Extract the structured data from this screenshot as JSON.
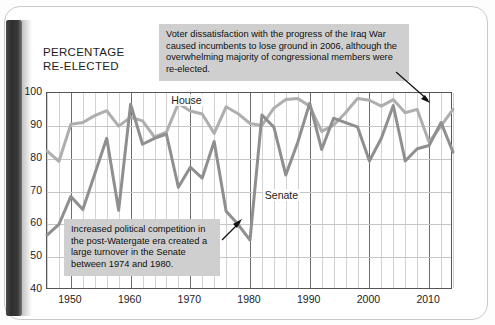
{
  "page": {
    "axis_title": "PERCENTAGE\nRE-ELECTED"
  },
  "callouts": [
    {
      "id": "iraq",
      "text": "Voter dissatisfaction with the progress of the Iraq War caused incumbents to lose ground in 2006, although the overwhelming majority of congressional members were re-elected."
    },
    {
      "id": "watergate",
      "text": "Increased political competition in the post-Watergate era created a large turnover in the Senate between 1974 and 1980."
    }
  ],
  "series_labels": {
    "house": "House",
    "senate": "Senate"
  },
  "colors": {
    "house": "#aeaeae",
    "senate": "#8f8f8f",
    "callout_bg": "#cfcfcf",
    "grid_minor": "#d2d2d2",
    "grid_major": "#6d6d6d",
    "frame": "#555555"
  },
  "chart_data": {
    "type": "line",
    "title": "",
    "xlabel": "",
    "ylabel": "PERCENTAGE RE-ELECTED",
    "xlim": [
      1946,
      2014
    ],
    "ylim": [
      40,
      100
    ],
    "ytick_labels": [
      "100",
      "90",
      "80",
      "70",
      "60",
      "50",
      "40"
    ],
    "yticks": [
      100,
      90,
      80,
      70,
      60,
      50,
      40
    ],
    "xtick_labels": [
      "1950",
      "1960",
      "1970",
      "1980",
      "1990",
      "2000",
      "2010"
    ],
    "xticks": [
      1950,
      1960,
      1970,
      1980,
      1990,
      2000,
      2010
    ],
    "minor_xtick_interval": 2,
    "grid": true,
    "legend": "inline-labels",
    "x": [
      1946,
      1948,
      1950,
      1952,
      1954,
      1956,
      1958,
      1960,
      1962,
      1964,
      1966,
      1968,
      1970,
      1972,
      1974,
      1976,
      1978,
      1980,
      1982,
      1984,
      1986,
      1988,
      1990,
      1992,
      1994,
      1996,
      1998,
      2000,
      2002,
      2004,
      2006,
      2008,
      2010,
      2012,
      2014
    ],
    "series": [
      {
        "name": "House",
        "color": "#aeaeae",
        "values": [
          82.4,
          79.2,
          90.5,
          91.0,
          93.1,
          94.6,
          89.9,
          92.6,
          91.5,
          86.6,
          88.1,
          96.8,
          94.5,
          93.6,
          87.7,
          95.8,
          93.7,
          90.7,
          90.1,
          95.4,
          98.0,
          98.3,
          96.0,
          88.3,
          90.2,
          94.0,
          98.3,
          97.8,
          96.0,
          98.0,
          94.0,
          95.0,
          85.0,
          90.0,
          95.0
        ]
      },
      {
        "name": "Senate",
        "color": "#8f8f8f",
        "values": [
          56.7,
          60.0,
          68.5,
          64.5,
          75.3,
          86.2,
          64.3,
          96.6,
          84.4,
          86.2,
          87.5,
          71.3,
          77.4,
          74.1,
          85.2,
          64.0,
          60.0,
          55.2,
          93.3,
          89.6,
          75.0,
          85.0,
          96.9,
          82.8,
          92.3,
          91.0,
          89.7,
          79.3,
          86.2,
          96.2,
          79.3,
          83.0,
          84.0,
          91.0,
          82.0
        ]
      }
    ],
    "annotations": [
      {
        "text": "Voter dissatisfaction with the progress of the Iraq War caused incumbents to lose ground in 2006, although the overwhelming majority of congressional members were re-elected.",
        "points_to_year": 2006
      },
      {
        "text": "Increased political competition in the post-Watergate era created a large turnover in the Senate between 1974 and 1980.",
        "points_to_year": 1978
      }
    ]
  }
}
